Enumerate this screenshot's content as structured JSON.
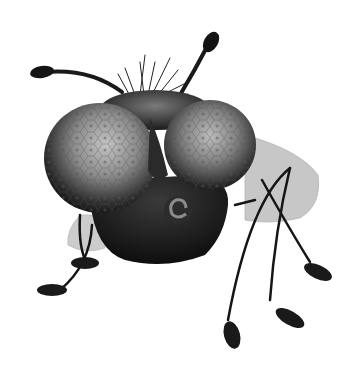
{
  "image": {
    "subject": "stylized fly illustration",
    "background": "#ffffff",
    "colors": {
      "body": "#141414",
      "eye_light": "#b8b8b8",
      "eye_dark": "#1c1c1c",
      "wing": "#9a9a9a"
    }
  }
}
